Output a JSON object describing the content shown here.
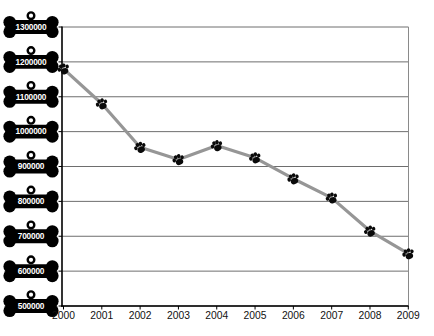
{
  "chart_data": {
    "type": "line",
    "categories": [
      "2000",
      "2001",
      "2002",
      "2003",
      "2004",
      "2005",
      "2006",
      "2007",
      "2008",
      "2009"
    ],
    "values": [
      1180000,
      1080000,
      955000,
      920000,
      960000,
      925000,
      865000,
      810000,
      715000,
      650000
    ],
    "ylim": [
      500000,
      1300000
    ],
    "ytick_step": 100000,
    "ytick_labels": [
      "1300000",
      "1200000",
      "1100000",
      "1000000",
      "900000",
      "800000",
      "700000",
      "600000",
      "500000"
    ],
    "xlabel": "",
    "ylabel": "",
    "grid": "horizontal",
    "legend": "none",
    "marker_icon": "paw-print-icon",
    "ytick_badge_icon": "dog-bone-tag-icon",
    "colors": {
      "background": "#ffffff",
      "line": "#969696",
      "marker": "#0a0a0a",
      "gridline": "#6e6e6e",
      "plot_border": "#8a8a8a",
      "axis": "#000000",
      "badge_fill": "#000000",
      "badge_text": "#ffffff",
      "xtick_text": "#111111"
    }
  }
}
